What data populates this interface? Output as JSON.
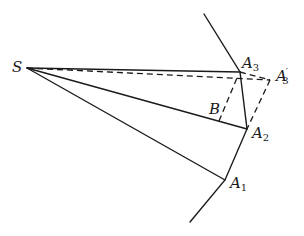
{
  "diagram": {
    "type": "geometry",
    "points": {
      "S": {
        "label": "S",
        "x": 27,
        "y": 68
      },
      "A1": {
        "label": "A",
        "sub": "1",
        "x": 225,
        "y": 180
      },
      "A2": {
        "label": "A",
        "sub": "2",
        "x": 247,
        "y": 129
      },
      "A3": {
        "label": "A",
        "sub": "3",
        "x": 240,
        "y": 72
      },
      "A3p": {
        "label": "A",
        "prime": "′",
        "sub": "3",
        "x": 270,
        "y": 80
      },
      "B": {
        "label": "B",
        "x": 219,
        "y": 121
      }
    },
    "labels": {
      "S": "S",
      "A1": "A",
      "A1_sub": "1",
      "A2": "A",
      "A2_sub": "2",
      "A3": "A",
      "A3_sub": "3",
      "A3p": "A",
      "A3p_prime": "′",
      "A3p_sub": "3",
      "B": "B"
    },
    "solid_segments": [
      [
        "S",
        "A1"
      ],
      [
        "S",
        "A2"
      ],
      [
        "S",
        "A3"
      ],
      [
        "top_end",
        "A3"
      ],
      [
        "A3",
        "A2"
      ],
      [
        "A2",
        "A1"
      ],
      [
        "A1",
        "bottom_end"
      ]
    ],
    "dashed_segments": [
      [
        "S",
        "A3p"
      ],
      [
        "A3",
        "A3p"
      ],
      [
        "B",
        "C"
      ],
      [
        "C",
        "A3p"
      ],
      [
        "A3p",
        "A2"
      ]
    ]
  }
}
